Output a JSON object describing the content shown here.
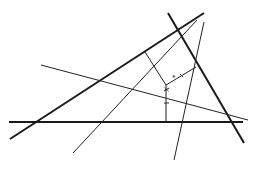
{
  "diagram": {
    "type": "geometry",
    "point_label": "x",
    "point_label_superscript": "*",
    "point": {
      "x": 166,
      "y": 85
    },
    "label_position": {
      "x": 169,
      "y": 92
    },
    "thick_lines": [
      {
        "id": "side-a",
        "x1": 10,
        "y1": 139,
        "x2": 204,
        "y2": 13
      },
      {
        "id": "side-b",
        "x1": 9,
        "y1": 122,
        "x2": 243,
        "y2": 122
      },
      {
        "id": "side-c",
        "x1": 168,
        "y1": 13,
        "x2": 244,
        "y2": 143
      }
    ],
    "thin_lines": [
      {
        "id": "line-1",
        "x1": 73,
        "y1": 153,
        "x2": 197,
        "y2": 20
      },
      {
        "id": "line-2",
        "x1": 174,
        "y1": 160,
        "x2": 204,
        "y2": 22
      },
      {
        "id": "line-3",
        "x1": 41,
        "y1": 65,
        "x2": 248,
        "y2": 120
      }
    ],
    "perpendiculars": [
      {
        "id": "perp-to-a",
        "x1": 166,
        "y1": 85,
        "x2": 145,
        "y2": 52
      },
      {
        "id": "perp-to-c",
        "x1": 166,
        "y1": 85,
        "x2": 196,
        "y2": 67
      },
      {
        "id": "perp-to-b",
        "x1": 166,
        "y1": 85,
        "x2": 166,
        "y2": 122
      }
    ],
    "ticks": [
      {
        "x1": 180,
        "y1": 74,
        "x2": 183,
        "y2": 77
      },
      {
        "x1": 164,
        "y1": 103,
        "x2": 169,
        "y2": 103
      }
    ],
    "colors": {
      "stroke": "#1a1a1a",
      "background": "#ffffff"
    }
  }
}
